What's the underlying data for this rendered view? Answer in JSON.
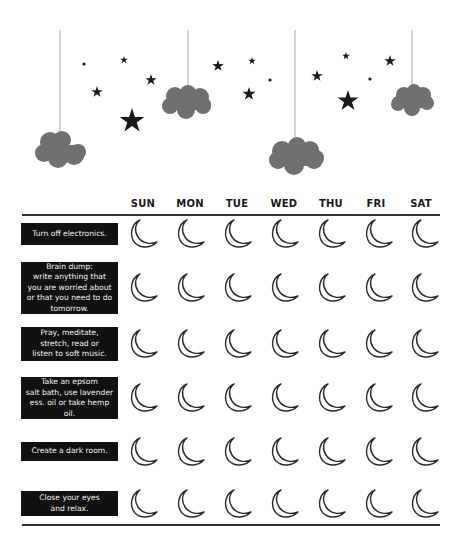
{
  "decor": {
    "icons": [
      "cloud-icon",
      "star-icon",
      "dot-icon"
    ],
    "colors": {
      "cloud": "#707070",
      "star": "#1a1a1a",
      "string": "#aaaaaa"
    }
  },
  "header": {
    "days": [
      "SUN",
      "MON",
      "TUE",
      "WED",
      "THU",
      "FRI",
      "SAT"
    ]
  },
  "rows": [
    {
      "label": "Turn off electronics.",
      "checkbox_icon": "moon-icon"
    },
    {
      "label": "Brain dump: write anything that you are worried about or that you need to do tomorrow.",
      "checkbox_icon": "moon-icon"
    },
    {
      "label": "Pray, meditate, stretch, read or listen to soft music.",
      "checkbox_icon": "moon-icon"
    },
    {
      "label": "Take an epsom salt bath, use lavender ess. oil or take hemp oil.",
      "checkbox_icon": "moon-icon"
    },
    {
      "label": "Create a dark room.",
      "checkbox_icon": "moon-icon"
    },
    {
      "label": "Close your eyes and relax.",
      "checkbox_icon": "moon-icon"
    }
  ],
  "label_lines": [
    [
      "Turn off electronics."
    ],
    [
      "Brain dump:",
      "write anything that",
      "you are worried about",
      "or that you need to do",
      "tomorrow."
    ],
    [
      "Pray, meditate,",
      "stretch, read or",
      "listen to soft music."
    ],
    [
      "Take an epsom",
      "salt bath, use lavender",
      "ess. oil or take hemp oil."
    ],
    [
      "Create a dark room."
    ],
    [
      "Close your eyes",
      "and relax."
    ]
  ]
}
